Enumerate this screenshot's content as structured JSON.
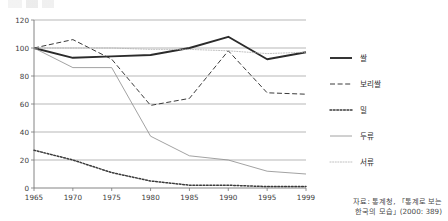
{
  "chart_data": {
    "type": "line",
    "title": "",
    "subtitle": "",
    "xlabel": "",
    "ylabel": "",
    "x": [
      1965,
      1970,
      1975,
      1980,
      1985,
      1990,
      1995,
      1999
    ],
    "xtick_labels": [
      "1965",
      "1970",
      "1975",
      "1980",
      "1985",
      "1990",
      "1995",
      "1999"
    ],
    "ytick_labels": [
      "0",
      "20",
      "40",
      "60",
      "80",
      "100",
      "120"
    ],
    "yticks": [
      0,
      20,
      40,
      60,
      80,
      100,
      120
    ],
    "ylim": [
      0,
      120
    ],
    "grid": "horizontal",
    "legend_position": "right",
    "series": [
      {
        "name": "쌀",
        "style": "solid-thick",
        "color": "#2b2b2b",
        "values": [
          100,
          93,
          94,
          95,
          100,
          108,
          92,
          97
        ]
      },
      {
        "name": "보리쌀",
        "style": "dashed",
        "color": "#3a3a3a",
        "values": [
          100,
          106,
          92,
          59,
          64,
          98,
          68,
          67
        ]
      },
      {
        "name": "밀",
        "style": "dotted-bold",
        "color": "#3a3a3a",
        "values": [
          27,
          20,
          11,
          5,
          2,
          2,
          1,
          1
        ]
      },
      {
        "name": "두류",
        "style": "solid-thin",
        "color": "#8a8a8a",
        "values": [
          100,
          86,
          86,
          37,
          23,
          20,
          12,
          10
        ]
      },
      {
        "name": "서류",
        "style": "dotted-fine",
        "color": "#b0b0b0",
        "values": [
          100,
          100,
          100,
          99,
          99,
          98,
          96,
          97
        ]
      }
    ]
  },
  "legend": {
    "items": [
      {
        "label": "쌀"
      },
      {
        "label": "보리쌀"
      },
      {
        "label": "밀"
      },
      {
        "label": "두류"
      },
      {
        "label": "서류"
      }
    ]
  },
  "source": {
    "line1": "자료: 통계청, 「통계로 보는",
    "line2": "한국의 모습」(2000: 389)"
  },
  "axes": {
    "plot_left": 34,
    "plot_right": 306,
    "plot_top": 20,
    "plot_bottom": 188
  }
}
